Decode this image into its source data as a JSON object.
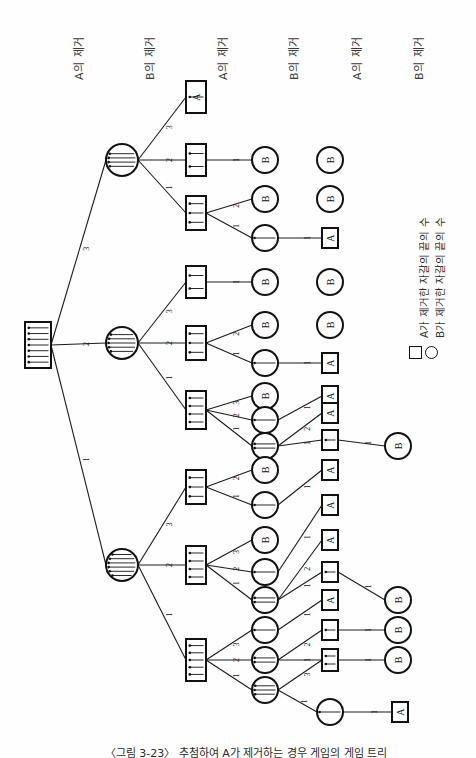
{
  "figure": {
    "caption": "〈그림 3-23〉  추첨하여 A가 제거하는 경우 게임의 게임 트리",
    "orientation": "rotated-90-ccw"
  },
  "column_headers": [
    {
      "id": "h1",
      "label": "A의 제거"
    },
    {
      "id": "h2",
      "label": "B의 제거"
    },
    {
      "id": "h3",
      "label": "A의 제거"
    },
    {
      "id": "h4",
      "label": "B의 제거"
    },
    {
      "id": "h5",
      "label": "A의 제거"
    },
    {
      "id": "h6",
      "label": "B의 제거"
    }
  ],
  "legend": {
    "items": [
      {
        "symbol": "square",
        "symbol_name": "square-node-icon",
        "label": "A가 제거한 자갈의 끝의 수"
      },
      {
        "symbol": "circle",
        "symbol_name": "circle-node-icon",
        "label": "B가 제거한 자갈의 끝의 수"
      }
    ]
  },
  "chart_data": {
    "type": "diagram",
    "title": "게임 트리",
    "node_shapes": {
      "square": "A's move / A to move",
      "circle": "B's move / B to move"
    },
    "edge_labels": [
      "1",
      "2",
      "3"
    ],
    "terminal_labels": [
      "A",
      "B"
    ],
    "root": {
      "id": "n0",
      "shape": "square",
      "pebbles": 7
    },
    "nodes": [
      {
        "id": "n0",
        "shape": "square",
        "pebbles": 7,
        "x": 38,
        "y": 345,
        "w": 26,
        "h": 46
      },
      {
        "id": "n1",
        "shape": "circle",
        "pebbles": 4,
        "x": 122,
        "y": 160,
        "r": 16
      },
      {
        "id": "n2",
        "shape": "circle",
        "pebbles": 5,
        "x": 122,
        "y": 343,
        "r": 16
      },
      {
        "id": "n3",
        "shape": "circle",
        "pebbles": 6,
        "x": 122,
        "y": 565,
        "r": 16
      },
      {
        "id": "n4",
        "shape": "square",
        "pebbles": 1,
        "x": 196,
        "y": 97,
        "w": 20,
        "h": 32
      },
      {
        "id": "n5",
        "shape": "square",
        "pebbles": 2,
        "x": 196,
        "y": 160,
        "w": 20,
        "h": 32
      },
      {
        "id": "n6",
        "shape": "square",
        "pebbles": 3,
        "x": 196,
        "y": 213,
        "w": 20,
        "h": 34
      },
      {
        "id": "n7",
        "shape": "square",
        "pebbles": 2,
        "x": 196,
        "y": 282,
        "w": 20,
        "h": 32
      },
      {
        "id": "n8",
        "shape": "square",
        "pebbles": 3,
        "x": 196,
        "y": 343,
        "w": 20,
        "h": 34
      },
      {
        "id": "n9",
        "shape": "square",
        "pebbles": 4,
        "x": 196,
        "y": 410,
        "w": 20,
        "h": 38
      },
      {
        "id": "n10",
        "shape": "square",
        "pebbles": 3,
        "x": 196,
        "y": 487,
        "w": 20,
        "h": 34
      },
      {
        "id": "n11",
        "shape": "square",
        "pebbles": 4,
        "x": 196,
        "y": 565,
        "w": 20,
        "h": 38
      },
      {
        "id": "n12",
        "shape": "square",
        "pebbles": 5,
        "x": 196,
        "y": 660,
        "w": 20,
        "h": 42
      },
      {
        "id": "n13",
        "shape": "circle",
        "pebbles": 0,
        "x": 265,
        "y": 160,
        "r": 13,
        "terminal": false
      },
      {
        "id": "n14",
        "shape": "circle",
        "pebbles": 0,
        "x": 265,
        "y": 199,
        "r": 13
      },
      {
        "id": "n15",
        "shape": "circle",
        "pebbles": 1,
        "x": 265,
        "y": 238,
        "r": 13
      },
      {
        "id": "n16",
        "shape": "circle",
        "pebbles": 0,
        "x": 265,
        "y": 282,
        "r": 13
      },
      {
        "id": "n17",
        "shape": "circle",
        "pebbles": 0,
        "x": 265,
        "y": 325,
        "r": 13
      },
      {
        "id": "n18",
        "shape": "circle",
        "pebbles": 1,
        "x": 265,
        "y": 363,
        "r": 13
      },
      {
        "id": "n19",
        "shape": "circle",
        "pebbles": 0,
        "x": 265,
        "y": 396,
        "r": 13
      },
      {
        "id": "n20",
        "shape": "circle",
        "pebbles": 1,
        "x": 265,
        "y": 420,
        "r": 13
      },
      {
        "id": "n21",
        "shape": "circle",
        "pebbles": 2,
        "x": 265,
        "y": 446,
        "r": 13
      },
      {
        "id": "n22",
        "shape": "circle",
        "pebbles": 0,
        "x": 265,
        "y": 470,
        "r": 13
      },
      {
        "id": "n23",
        "shape": "circle",
        "pebbles": 1,
        "x": 265,
        "y": 505,
        "r": 13
      },
      {
        "id": "n24",
        "shape": "circle",
        "pebbles": 0,
        "x": 265,
        "y": 540,
        "r": 13
      },
      {
        "id": "n25",
        "shape": "circle",
        "pebbles": 1,
        "x": 265,
        "y": 572,
        "r": 13
      },
      {
        "id": "n26",
        "shape": "circle",
        "pebbles": 2,
        "x": 265,
        "y": 600,
        "r": 13
      },
      {
        "id": "n27",
        "shape": "circle",
        "pebbles": 1,
        "x": 265,
        "y": 630,
        "r": 13
      },
      {
        "id": "n28",
        "shape": "circle",
        "pebbles": 2,
        "x": 265,
        "y": 660,
        "r": 13
      },
      {
        "id": "n29",
        "shape": "circle",
        "pebbles": 3,
        "x": 265,
        "y": 690,
        "r": 13
      },
      {
        "id": "n30",
        "shape": "square",
        "pebbles": 0,
        "x": 330,
        "y": 238,
        "w": 16,
        "h": 20
      },
      {
        "id": "n31",
        "shape": "square",
        "pebbles": 0,
        "x": 330,
        "y": 363,
        "w": 16,
        "h": 20
      },
      {
        "id": "n32",
        "shape": "square",
        "pebbles": 0,
        "x": 330,
        "y": 396,
        "w": 16,
        "h": 20
      },
      {
        "id": "n33",
        "shape": "square",
        "pebbles": 0,
        "x": 330,
        "y": 413,
        "w": 16,
        "h": 20
      },
      {
        "id": "n34",
        "shape": "square",
        "pebbles": 1,
        "x": 330,
        "y": 440,
        "w": 16,
        "h": 20
      },
      {
        "id": "n35",
        "shape": "square",
        "pebbles": 0,
        "x": 330,
        "y": 470,
        "w": 16,
        "h": 20
      },
      {
        "id": "n36",
        "shape": "square",
        "pebbles": 0,
        "x": 330,
        "y": 505,
        "w": 16,
        "h": 20
      },
      {
        "id": "n37",
        "shape": "square",
        "pebbles": 0,
        "x": 330,
        "y": 540,
        "w": 16,
        "h": 20
      },
      {
        "id": "n38",
        "shape": "square",
        "pebbles": 1,
        "x": 330,
        "y": 572,
        "w": 16,
        "h": 20
      },
      {
        "id": "n39",
        "shape": "square",
        "pebbles": 0,
        "x": 330,
        "y": 600,
        "w": 16,
        "h": 20
      },
      {
        "id": "n40",
        "shape": "square",
        "pebbles": 1,
        "x": 330,
        "y": 630,
        "w": 16,
        "h": 20
      },
      {
        "id": "n41",
        "shape": "square",
        "pebbles": 2,
        "x": 330,
        "y": 660,
        "w": 16,
        "h": 22
      },
      {
        "id": "n42",
        "shape": "circle",
        "pebbles": 1,
        "x": 330,
        "y": 712,
        "r": 13
      },
      {
        "id": "n43",
        "shape": "square",
        "pebbles": 0,
        "x": 400,
        "y": 712,
        "w": 16,
        "h": 20
      },
      {
        "id": "t1",
        "shape": "circle",
        "terminal": true,
        "winner": "B",
        "x": 330,
        "y": 160,
        "r": 13
      },
      {
        "id": "t2",
        "shape": "circle",
        "terminal": true,
        "winner": "B",
        "x": 330,
        "y": 199,
        "r": 13
      },
      {
        "id": "t3",
        "shape": "circle",
        "terminal": true,
        "winner": "B",
        "x": 330,
        "y": 282,
        "r": 13
      },
      {
        "id": "t4",
        "shape": "circle",
        "terminal": true,
        "winner": "B",
        "x": 330,
        "y": 325,
        "r": 13
      },
      {
        "id": "t5",
        "shape": "circle",
        "terminal": true,
        "winner": "B",
        "x": 398,
        "y": 446,
        "r": 13
      },
      {
        "id": "t6",
        "shape": "circle",
        "terminal": true,
        "winner": "B",
        "x": 398,
        "y": 600,
        "r": 13
      },
      {
        "id": "t7",
        "shape": "circle",
        "terminal": true,
        "winner": "B",
        "x": 398,
        "y": 630,
        "r": 13
      },
      {
        "id": "t8",
        "shape": "circle",
        "terminal": true,
        "winner": "B",
        "x": 398,
        "y": 660,
        "r": 13
      }
    ],
    "edges": [
      {
        "from": "n0",
        "to": "n1",
        "label": "3"
      },
      {
        "from": "n0",
        "to": "n2",
        "label": "2"
      },
      {
        "from": "n0",
        "to": "n3",
        "label": "1"
      },
      {
        "from": "n1",
        "to": "n4",
        "label": "3"
      },
      {
        "from": "n1",
        "to": "n5",
        "label": "2"
      },
      {
        "from": "n1",
        "to": "n6",
        "label": "1"
      },
      {
        "from": "n2",
        "to": "n7",
        "label": "3"
      },
      {
        "from": "n2",
        "to": "n8",
        "label": "2"
      },
      {
        "from": "n2",
        "to": "n9",
        "label": "1"
      },
      {
        "from": "n3",
        "to": "n10",
        "label": "3"
      },
      {
        "from": "n3",
        "to": "n11",
        "label": "2"
      },
      {
        "from": "n3",
        "to": "n12",
        "label": "1"
      },
      {
        "from": "n5",
        "to": "n13",
        "label": "1"
      },
      {
        "from": "n6",
        "to": "n14",
        "label": "2"
      },
      {
        "from": "n6",
        "to": "n15",
        "label": "1"
      },
      {
        "from": "n15",
        "to": "n30",
        "label": "1"
      },
      {
        "from": "n7",
        "to": "n16",
        "label": "1"
      },
      {
        "from": "n8",
        "to": "n17",
        "label": "2"
      },
      {
        "from": "n8",
        "to": "n18",
        "label": "1"
      },
      {
        "from": "n18",
        "to": "n31",
        "label": "1"
      },
      {
        "from": "n9",
        "to": "n19",
        "label": "3"
      },
      {
        "from": "n9",
        "to": "n20",
        "label": "2"
      },
      {
        "from": "n9",
        "to": "n21",
        "label": "1"
      },
      {
        "from": "n20",
        "to": "n32",
        "label": "1"
      },
      {
        "from": "n21",
        "to": "n33",
        "label": "2"
      },
      {
        "from": "n21",
        "to": "n34",
        "label": "1"
      },
      {
        "from": "n34",
        "to": "t5",
        "label": "1"
      },
      {
        "from": "n10",
        "to": "n22",
        "label": "2"
      },
      {
        "from": "n10",
        "to": "n23",
        "label": "1"
      },
      {
        "from": "n23",
        "to": "n35",
        "label": "1"
      },
      {
        "from": "n11",
        "to": "n24",
        "label": "3"
      },
      {
        "from": "n11",
        "to": "n25",
        "label": "2"
      },
      {
        "from": "n11",
        "to": "n26",
        "label": "1"
      },
      {
        "from": "n25",
        "to": "n36",
        "label": "1"
      },
      {
        "from": "n26",
        "to": "n37",
        "label": "2"
      },
      {
        "from": "n26",
        "to": "n38",
        "label": "1"
      },
      {
        "from": "n38",
        "to": "t6",
        "label": "1"
      },
      {
        "from": "n12",
        "to": "n27",
        "label": "3"
      },
      {
        "from": "n12",
        "to": "n28",
        "label": "2"
      },
      {
        "from": "n12",
        "to": "n29",
        "label": "1"
      },
      {
        "from": "n27",
        "to": "n39",
        "label": "1"
      },
      {
        "from": "n28",
        "to": "n40",
        "label": "2"
      },
      {
        "from": "n28",
        "to": "n41",
        "label": "1"
      },
      {
        "from": "n29",
        "to": "n41",
        "label": "3"
      },
      {
        "from": "n29",
        "to": "n42",
        "label": "1"
      },
      {
        "from": "n40",
        "to": "t7",
        "label": "1"
      },
      {
        "from": "n41",
        "to": "t8",
        "label": "1"
      },
      {
        "from": "n42",
        "to": "n43",
        "label": "1"
      },
      {
        "from": "n4",
        "to": "term_A1",
        "label": ""
      }
    ],
    "terminal_winner_labels": [
      {
        "id": "n4",
        "winner": "A"
      },
      {
        "id": "n30",
        "winner": "A"
      },
      {
        "id": "n31",
        "winner": "A"
      },
      {
        "id": "n32",
        "winner": "A"
      },
      {
        "id": "n33",
        "winner": "A"
      },
      {
        "id": "n35",
        "winner": "A"
      },
      {
        "id": "n36",
        "winner": "A"
      },
      {
        "id": "n37",
        "winner": "A"
      },
      {
        "id": "n39",
        "winner": "A"
      },
      {
        "id": "n43",
        "winner": "A"
      },
      {
        "id": "n13",
        "winner": "B"
      },
      {
        "id": "n14",
        "winner": "B"
      },
      {
        "id": "n16",
        "winner": "B"
      },
      {
        "id": "n17",
        "winner": "B"
      },
      {
        "id": "n19",
        "winner": "B"
      },
      {
        "id": "n22",
        "winner": "B"
      },
      {
        "id": "n24",
        "winner": "B"
      }
    ]
  }
}
